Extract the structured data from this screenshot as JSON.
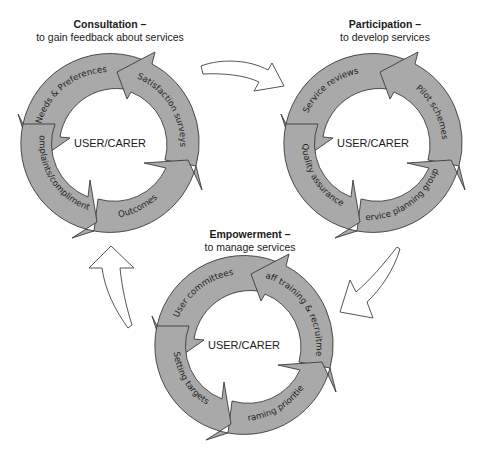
{
  "colors": {
    "segment_fill": "#a9a9a9",
    "segment_stroke": "#3a3a3a",
    "connector_fill": "#ffffff",
    "text": "#1a1a1a"
  },
  "cycles": [
    {
      "id": "consultation",
      "title": "Consultation –",
      "subtitle": "to gain feedback about services",
      "center": "USER/CARER",
      "segments": [
        "Needs & Preferences",
        "Satisfaction surveys",
        "Outcomes",
        "Complaints/compliments"
      ]
    },
    {
      "id": "participation",
      "title": "Participation –",
      "subtitle": "to develop services",
      "center": "USER/CARER",
      "segments": [
        "Service reviews",
        "Pilot schemes",
        "Service planning groups",
        "Quality assurance"
      ]
    },
    {
      "id": "empowerment",
      "title": "Empowerment –",
      "subtitle": "to manage services",
      "center": "USER/CARER",
      "segments": [
        "User committees",
        "Staff training & recruitment",
        "Framing priorities",
        "Setting targets"
      ]
    }
  ],
  "connectors": [
    {
      "from": "consultation",
      "to": "participation",
      "icon": "curved-arrow-right"
    },
    {
      "from": "participation",
      "to": "empowerment",
      "icon": "curved-arrow-down-left"
    },
    {
      "from": "empowerment",
      "to": "consultation",
      "icon": "curved-arrow-up"
    }
  ]
}
